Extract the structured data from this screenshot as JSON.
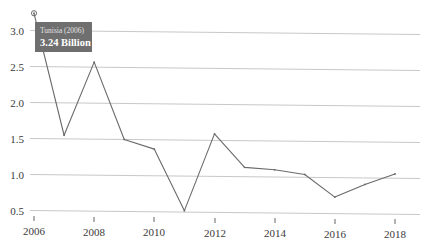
{
  "chart_data": {
    "type": "line",
    "title": "",
    "subtitle": "",
    "xlabel": "",
    "ylabel": "",
    "x": [
      2006,
      2007,
      2008,
      2009,
      2010,
      2011,
      2012,
      2013,
      2014,
      2015,
      2016,
      2017,
      2018
    ],
    "values": [
      3.24,
      1.55,
      2.57,
      1.5,
      1.37,
      0.52,
      1.59,
      1.13,
      1.1,
      1.04,
      0.73,
      0.91,
      1.06
    ],
    "series": [
      {
        "name": "Tunisia",
        "values": [
          3.24,
          1.55,
          2.57,
          1.5,
          1.37,
          0.52,
          1.59,
          1.13,
          1.1,
          1.04,
          0.73,
          0.91,
          1.06
        ]
      }
    ],
    "xlim": [
      2006,
      2018
    ],
    "ylim": [
      0.35,
      3.35
    ],
    "xticks": [
      2006,
      2008,
      2010,
      2012,
      2014,
      2016,
      2018
    ],
    "xtick_labels": [
      "2006",
      "2008",
      "2010",
      "2012",
      "2014",
      "2016",
      "2018"
    ],
    "yticks": [
      0.5,
      1.0,
      1.5,
      2.0,
      2.5,
      3.0
    ],
    "ytick_labels": [
      "0.5",
      "1.0",
      "1.5",
      "2.0",
      "2.5",
      "3.0"
    ],
    "grid": true,
    "grid_axis": "y",
    "legend": false,
    "legend_position": "none",
    "line_color": "#6a6a6a",
    "grid_color": "#c8c8c8",
    "background_color": "#ffffff",
    "marker": "circle",
    "highlight_point": {
      "x": 2006,
      "y": 3.24
    },
    "annotations": [
      {
        "kind": "tooltip",
        "title": "Tunisia (2006)",
        "value": "3.24 Billion",
        "numeric_value": 3.24,
        "unit": "Billion",
        "attached_to_x": 2006,
        "background_color": "#6f6f6f",
        "title_color": "#e2e2e2",
        "value_color": "#ffffff"
      }
    ]
  },
  "tooltip": {
    "title": "Tunisia (2006)",
    "value": "3.24 Billion"
  },
  "axes": {
    "y_labels": [
      "3.0",
      "2.5",
      "2.0",
      "1.5",
      "1.0",
      "0.5"
    ],
    "x_labels": [
      "2006",
      "2008",
      "2010",
      "2012",
      "2014",
      "2016",
      "2018"
    ]
  }
}
